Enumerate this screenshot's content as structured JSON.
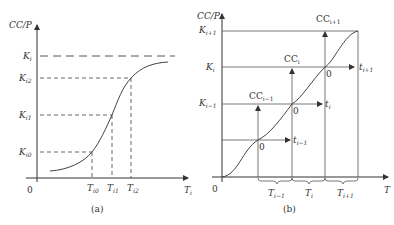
{
  "panel_a": {
    "caption": "(a)",
    "y_axis_label": "CC/P",
    "x_axis_label": {
      "main": "T",
      "sub": "i"
    },
    "origin": "0",
    "y_ticks": [
      {
        "main": "K",
        "sub": "i"
      },
      {
        "main": "K",
        "sub": "i2"
      },
      {
        "main": "K",
        "sub": "i1"
      },
      {
        "main": "K",
        "sub": "i0"
      }
    ],
    "x_ticks": [
      {
        "main": "T",
        "sub": "i0"
      },
      {
        "main": "T",
        "sub": "i1"
      },
      {
        "main": "T",
        "sub": "i2"
      }
    ]
  },
  "panel_b": {
    "caption": "(b)",
    "y_axis_label": "CC/P",
    "x_axis_label": "T",
    "origin": "0",
    "y_ticks": [
      {
        "main": "K",
        "sub": "i+1"
      },
      {
        "main": "K",
        "sub": "i"
      },
      {
        "main": "K",
        "sub": "i−1"
      }
    ],
    "cc_labels": [
      {
        "main": "CC",
        "sub": "i−1"
      },
      {
        "main": "CC",
        "sub": "i"
      },
      {
        "main": "CC",
        "sub": "i+1"
      }
    ],
    "t_labels": [
      {
        "main": "t",
        "sub": "i−1"
      },
      {
        "main": "t",
        "sub": "i"
      },
      {
        "main": "t",
        "sub": "i+1"
      }
    ],
    "local_origin": "0",
    "period_labels": [
      {
        "main": "T",
        "sub": "i−1"
      },
      {
        "main": "T",
        "sub": "i"
      },
      {
        "main": "T",
        "sub": "i+1"
      }
    ]
  }
}
